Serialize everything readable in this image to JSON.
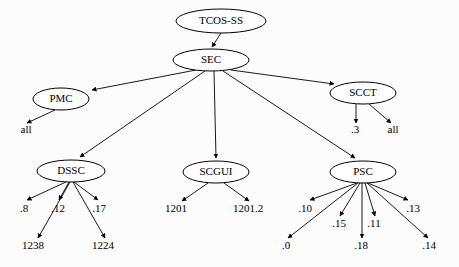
{
  "diagram": {
    "type": "tree",
    "background_color": "#fcfcfc",
    "line_color": "#000000",
    "node_fill": "#ffffff",
    "nodes": [
      {
        "id": "tcos",
        "label": "TCOS-SS",
        "cx": 221,
        "cy": 21,
        "rx": 45,
        "ry": 12
      },
      {
        "id": "sec",
        "label": "SEC",
        "cx": 211,
        "cy": 60,
        "rx": 38,
        "ry": 11
      },
      {
        "id": "pmc",
        "label": "PMC",
        "cx": 61,
        "cy": 99,
        "rx": 28,
        "ry": 11
      },
      {
        "id": "scct",
        "label": "SCCT",
        "cx": 363,
        "cy": 93,
        "rx": 33,
        "ry": 11
      },
      {
        "id": "dssc",
        "label": "DSSC",
        "cx": 71,
        "cy": 171,
        "rx": 34,
        "ry": 11
      },
      {
        "id": "scgui",
        "label": "SCGUI",
        "cx": 216,
        "cy": 172,
        "rx": 33,
        "ry": 11
      },
      {
        "id": "psc",
        "label": "PSC",
        "cx": 363,
        "cy": 172,
        "rx": 33,
        "ry": 11
      }
    ],
    "leaves": [
      {
        "id": "pmc-all",
        "label": "all",
        "x": 26,
        "y": 133,
        "parent": "pmc"
      },
      {
        "id": "scct-3",
        "label": ".3",
        "x": 355,
        "y": 133,
        "parent": "scct"
      },
      {
        "id": "scct-all",
        "label": "all",
        "x": 393,
        "y": 133,
        "parent": "scct"
      },
      {
        "id": "dssc-8",
        "label": ".8",
        "x": 24,
        "y": 212,
        "parent": "dssc"
      },
      {
        "id": "dssc-12",
        "label": ".12",
        "x": 58,
        "y": 212,
        "parent": "dssc"
      },
      {
        "id": "dssc-17",
        "label": ".17",
        "x": 99,
        "y": 212,
        "parent": "dssc"
      },
      {
        "id": "dssc-1238",
        "label": "1238",
        "x": 33,
        "y": 249,
        "parent": "dssc"
      },
      {
        "id": "dssc-1224",
        "label": "1224",
        "x": 103,
        "y": 249,
        "parent": "dssc"
      },
      {
        "id": "scgui-1201",
        "label": "1201",
        "x": 176,
        "y": 212,
        "parent": "scgui"
      },
      {
        "id": "scgui-1201-2",
        "label": "1201.2",
        "x": 248,
        "y": 212,
        "parent": "scgui"
      },
      {
        "id": "psc-10",
        "label": ".10",
        "x": 305,
        "y": 212,
        "parent": "psc"
      },
      {
        "id": "psc-15",
        "label": ".15",
        "x": 339,
        "y": 227,
        "parent": "psc"
      },
      {
        "id": "psc-11",
        "label": ".11",
        "x": 374,
        "y": 227,
        "parent": "psc"
      },
      {
        "id": "psc-13",
        "label": ".13",
        "x": 413,
        "y": 212,
        "parent": "psc"
      },
      {
        "id": "psc-0",
        "label": ".0",
        "x": 286,
        "y": 249,
        "parent": "psc"
      },
      {
        "id": "psc-18",
        "label": ".18",
        "x": 361,
        "y": 249,
        "parent": "psc"
      },
      {
        "id": "psc-14",
        "label": ".14",
        "x": 429,
        "y": 249,
        "parent": "psc"
      }
    ],
    "edges": [
      {
        "from": "tcos",
        "to": "sec",
        "x1": 221,
        "y1": 33,
        "x2": 212,
        "y2": 47
      },
      {
        "from": "sec",
        "to": "pmc",
        "x1": 196,
        "y1": 70,
        "x2": 92,
        "y2": 90
      },
      {
        "from": "sec",
        "to": "scct",
        "x1": 231,
        "y1": 70,
        "x2": 334,
        "y2": 84
      },
      {
        "from": "sec",
        "to": "dssc",
        "x1": 205,
        "y1": 71,
        "x2": 80,
        "y2": 157
      },
      {
        "from": "sec",
        "to": "scgui",
        "x1": 214,
        "y1": 71,
        "x2": 216,
        "y2": 158
      },
      {
        "from": "sec",
        "to": "psc",
        "x1": 223,
        "y1": 71,
        "x2": 355,
        "y2": 158
      },
      {
        "from": "pmc",
        "to": "pmc-all",
        "x1": 55,
        "y1": 110,
        "x2": 27,
        "y2": 123
      },
      {
        "from": "scct",
        "to": "scct-3",
        "x1": 356,
        "y1": 104,
        "x2": 356,
        "y2": 123
      },
      {
        "from": "scct",
        "to": "scct-all",
        "x1": 369,
        "y1": 104,
        "x2": 391,
        "y2": 123
      },
      {
        "from": "dssc",
        "to": "dssc-8",
        "x1": 66,
        "y1": 182,
        "x2": 27,
        "y2": 200
      },
      {
        "from": "dssc",
        "to": "dssc-12",
        "x1": 69,
        "y1": 182,
        "x2": 59,
        "y2": 200
      },
      {
        "from": "dssc",
        "to": "dssc-17",
        "x1": 74,
        "y1": 182,
        "x2": 98,
        "y2": 200
      },
      {
        "from": "dssc",
        "to": "dssc-1238",
        "x1": 70,
        "y1": 182,
        "x2": 38,
        "y2": 238
      },
      {
        "from": "dssc",
        "to": "dssc-1224",
        "x1": 73,
        "y1": 182,
        "x2": 105,
        "y2": 238
      },
      {
        "from": "scgui",
        "to": "scgui-1201",
        "x1": 208,
        "y1": 183,
        "x2": 182,
        "y2": 201
      },
      {
        "from": "scgui",
        "to": "scgui-1201-2",
        "x1": 224,
        "y1": 183,
        "x2": 249,
        "y2": 201
      },
      {
        "from": "psc",
        "to": "psc-10",
        "x1": 357,
        "y1": 183,
        "x2": 310,
        "y2": 200
      },
      {
        "from": "psc",
        "to": "psc-15",
        "x1": 360,
        "y1": 183,
        "x2": 340,
        "y2": 216
      },
      {
        "from": "psc",
        "to": "psc-11",
        "x1": 365,
        "y1": 183,
        "x2": 375,
        "y2": 216
      },
      {
        "from": "psc",
        "to": "psc-13",
        "x1": 368,
        "y1": 183,
        "x2": 408,
        "y2": 200
      },
      {
        "from": "psc",
        "to": "psc-0",
        "x1": 358,
        "y1": 183,
        "x2": 288,
        "y2": 238
      },
      {
        "from": "psc",
        "to": "psc-18",
        "x1": 362,
        "y1": 183,
        "x2": 362,
        "y2": 238
      },
      {
        "from": "psc",
        "to": "psc-14",
        "x1": 367,
        "y1": 183,
        "x2": 428,
        "y2": 238
      }
    ]
  }
}
